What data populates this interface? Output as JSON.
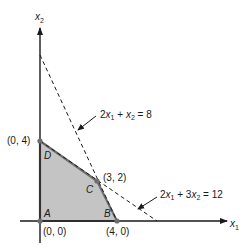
{
  "figure": {
    "axes": {
      "x_label": "x",
      "x_sub": "1",
      "y_label": "x",
      "y_sub": "2"
    },
    "feasible_region": {
      "fill": "#c4c4c4",
      "edge": "#6e6e6e",
      "vertices": [
        {
          "name": "A",
          "coords": "(0, 0)",
          "x": 0,
          "y": 0
        },
        {
          "name": "B",
          "coords": "(4, 0)",
          "x": 4,
          "y": 0
        },
        {
          "name": "C",
          "coords": "(3, 2)",
          "x": 3,
          "y": 2
        },
        {
          "name": "D",
          "coords": "(0, 4)",
          "x": 0,
          "y": 4
        }
      ]
    },
    "constraints": [
      {
        "label_prefix": "2x",
        "label": "2x₁ + x₂ = 8",
        "p1": [
          0,
          8
        ],
        "p2": [
          4,
          0
        ]
      },
      {
        "label": "2x₁ + 3x₂ = 12",
        "p1": [
          0,
          4
        ],
        "p2": [
          6,
          0
        ]
      }
    ],
    "labels": {
      "c1_a": "2",
      "c1_b": "x",
      "c1_b_sub": "1",
      "c1_c": " + ",
      "c1_d": "x",
      "c1_d_sub": "2",
      "c1_e": " = 8",
      "c2_a": "2",
      "c2_b": "x",
      "c2_b_sub": "1",
      "c2_c": " + 3",
      "c2_d": "x",
      "c2_d_sub": "2",
      "c2_e": " = 12"
    }
  }
}
